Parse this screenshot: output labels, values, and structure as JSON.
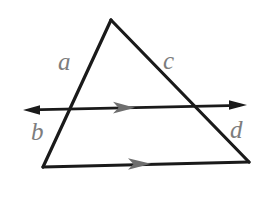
{
  "figure": {
    "name": "triangle-with-parallel-transversal",
    "canvas": {
      "width": 271,
      "height": 211,
      "background": "#ffffff"
    },
    "colors": {
      "stroke": "#1a1a1a",
      "label": "#7d7d7d",
      "parallel_marker": "#6e6e6e",
      "background": "#ffffff"
    },
    "triangle": {
      "name": "triangle",
      "apex": {
        "x": 111,
        "y": 20
      },
      "bottom_left": {
        "x": 43,
        "y": 167
      },
      "bottom_right": {
        "x": 249,
        "y": 162
      },
      "stroke_width": 3
    },
    "transversal": {
      "name": "horizontal-line",
      "start": {
        "x": 24,
        "y": 110
      },
      "end": {
        "x": 246,
        "y": 105
      },
      "stroke_width": 2.6,
      "arrowheads": [
        "left",
        "right"
      ],
      "parallel_marker_at": {
        "x": 127,
        "y": 108
      }
    },
    "base_marker": {
      "name": "base-parallel-marker",
      "at": {
        "x": 144,
        "y": 164
      }
    },
    "crossings": {
      "left_side": {
        "x": 68,
        "y": 108
      },
      "right_side": {
        "x": 194,
        "y": 107
      }
    },
    "labels": [
      {
        "id": "a",
        "text": "a",
        "x": 58,
        "y": 49,
        "size": 25
      },
      {
        "id": "c",
        "text": "c",
        "x": 163,
        "y": 48,
        "size": 25
      },
      {
        "id": "b",
        "text": "b",
        "x": 31,
        "y": 119,
        "size": 25
      },
      {
        "id": "d",
        "text": "d",
        "x": 230,
        "y": 117,
        "size": 25
      }
    ]
  }
}
